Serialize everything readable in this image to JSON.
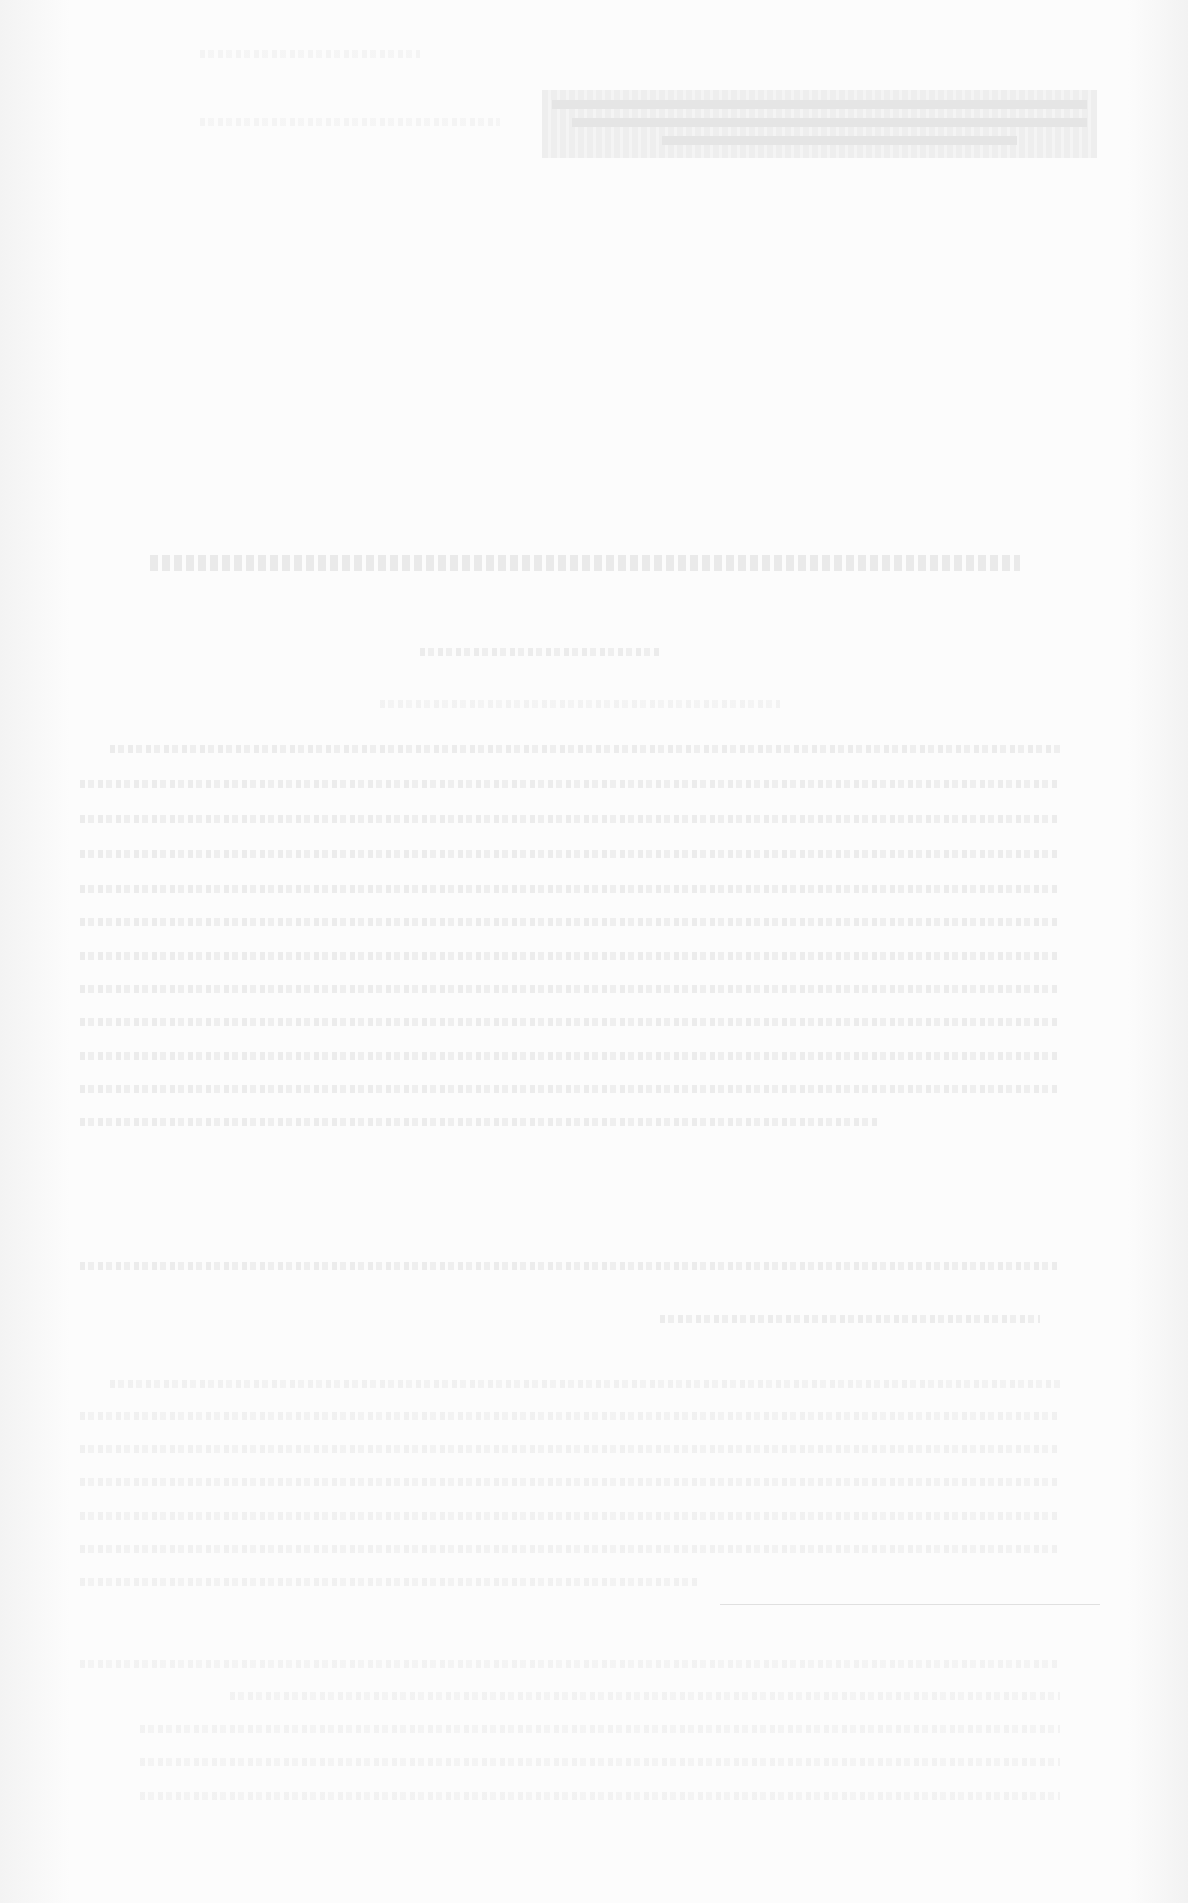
{
  "document": {
    "legibility": "illegible",
    "header": {
      "text": ""
    },
    "title": {
      "text": ""
    },
    "subtitle": {
      "text": ""
    },
    "body_paragraphs": [
      {
        "text": ""
      },
      {
        "text": ""
      }
    ],
    "footer_section": {
      "text": ""
    },
    "colors": {
      "paper": "#fcfcfc",
      "faded_ink": "#e6e6e6"
    }
  }
}
